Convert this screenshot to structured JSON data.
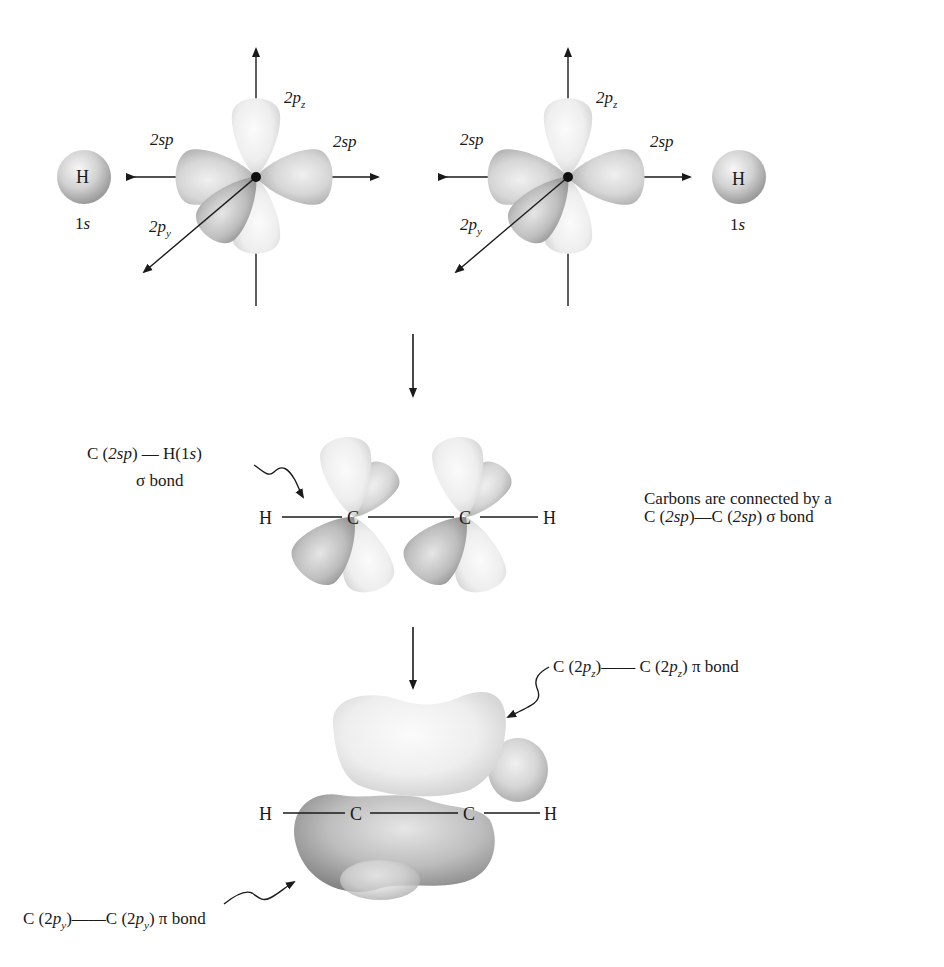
{
  "panel_top": {
    "left_h": {
      "atom": "H",
      "orbital": "1s",
      "orbital_num": "1",
      "orbital_letter": "s"
    },
    "left_c": {
      "sp_left": "2sp",
      "sp_right": "2sp",
      "pz_main": "2p",
      "pz_sub": "z",
      "py_main": "2p",
      "py_sub": "y"
    },
    "right_c": {
      "sp_left": "2sp",
      "sp_right": "2sp",
      "pz_main": "2p",
      "pz_sub": "z",
      "py_main": "2p",
      "py_sub": "y"
    },
    "right_h": {
      "atom": "H",
      "orbital_num": "1",
      "orbital_letter": "s"
    }
  },
  "panel_middle": {
    "ch_bond_label": {
      "c": "C",
      "p1": "(",
      "sp": "2sp",
      "p2": ")",
      "dash": " — ",
      "h": "H(1",
      "s": "s",
      "p3": ")"
    },
    "ch_bond_type": "σ bond",
    "atoms": {
      "h_left": "H",
      "c_left": "C",
      "c_right": "C",
      "h_right": "H"
    },
    "cc_note": {
      "line1": "Carbons are connected by a",
      "line2_c1": "C (",
      "line2_sp1": "2sp",
      "line2_mid": ")—C (",
      "line2_sp2": "2sp",
      "line2_end": ") σ bond"
    }
  },
  "panel_bottom": {
    "atoms": {
      "h_left": "H",
      "c_left": "C",
      "c_right": "C",
      "h_right": "H"
    },
    "pz_label": {
      "a": "C (2",
      "p": "p",
      "sub": "z",
      "b": ")—— C (2",
      "p2": "p",
      "sub2": "z",
      "c": ") π bond"
    },
    "py_label": {
      "a": "C (2",
      "p": "p",
      "sub": "y",
      "b": ")——C (2",
      "p2": "p",
      "sub2": "y",
      "c": ") π bond"
    }
  },
  "colors": {
    "lobe_light": "#f2f2f2",
    "lobe_mid": "#c9c9c9",
    "lobe_dark": "#8f8f8f",
    "line": "#1a1a1a"
  }
}
